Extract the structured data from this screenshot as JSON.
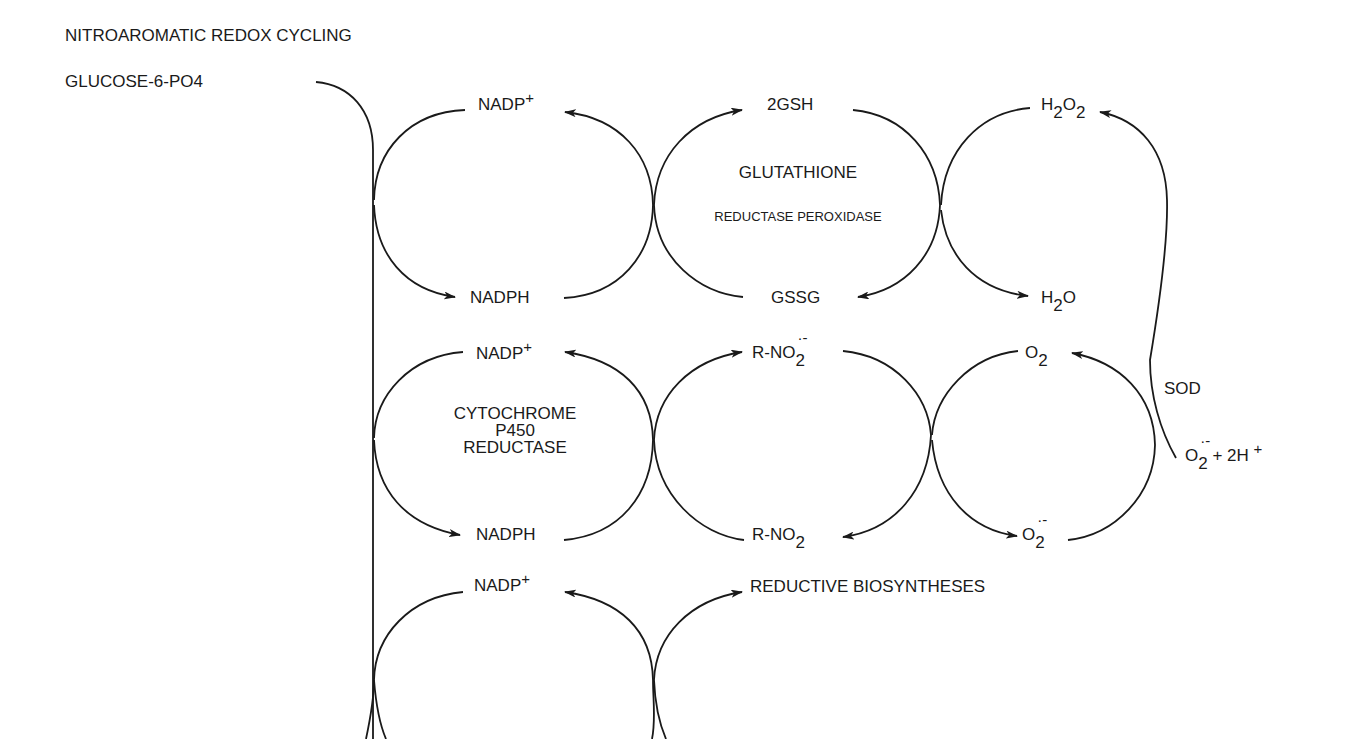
{
  "title": "NITROAROMATIC REDOX CYCLING",
  "source_label": "GLUCOSE-6-PO4",
  "rows": {
    "row1": {
      "left_top": {
        "base": "NADP",
        "sup": "+"
      },
      "left_bottom": "NADPH",
      "mid_top": "2GSH",
      "mid_bottom": "GSSG",
      "mid_enzyme_line1": "GLUTATHIONE",
      "mid_enzyme_line2": "REDUCTASE PEROXIDASE",
      "right_top": {
        "a": "H",
        "sub1": "2",
        "b": "O",
        "sub2": "2"
      },
      "right_bottom": {
        "a": "H",
        "sub1": "2",
        "b": "O"
      }
    },
    "row2": {
      "left_top": {
        "base": "NADP",
        "sup": "+"
      },
      "left_bottom": "NADPH",
      "left_enzyme": [
        "CYTOCHROME",
        "P450",
        "REDUCTASE"
      ],
      "mid_top": {
        "base": "R-NO",
        "sub": "2",
        "radical": "·-"
      },
      "mid_bottom": {
        "base": "R-NO",
        "sub": "2"
      },
      "right_top": {
        "base": "O",
        "sub": "2"
      },
      "right_bottom": {
        "base": "O",
        "sub": "2",
        "radical": "·-"
      },
      "side_enzyme": "SOD",
      "side_reactant": {
        "base": "O",
        "sub": "2",
        "radical": "·-",
        "plus": "+ 2H",
        "sup": "+"
      }
    },
    "row3": {
      "left_top": {
        "base": "NADP",
        "sup": "+"
      },
      "mid_top": "REDUCTIVE BIOSYNTHESES"
    }
  },
  "colors": {
    "line": "#1a1a1a",
    "background": "#ffffff"
  }
}
